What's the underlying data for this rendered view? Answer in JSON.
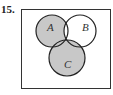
{
  "problem": {
    "number": "15."
  },
  "diagram": {
    "type": "venn",
    "sets": [
      {
        "label": "A",
        "cx": 52,
        "cy": 31,
        "r": 16
      },
      {
        "label": "B",
        "cx": 80,
        "cy": 31,
        "r": 16
      },
      {
        "label": "C",
        "cx": 67,
        "cy": 58,
        "r": 18
      }
    ],
    "shading": {
      "shaded_regions": "A ∪ C minus (A ∩ B ∩ C') ; triple overlap darker",
      "fill": "#c8c8c8",
      "overlap_fill": "#8f8f8f",
      "stroke": "#222222"
    }
  }
}
